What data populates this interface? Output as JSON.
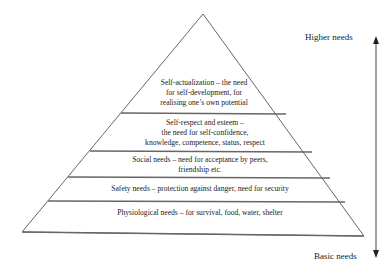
{
  "diagram": {
    "levels": [
      {
        "name": "self-actualization",
        "lines": [
          "Self-actualization – the need",
          "for self-development, for",
          "realising one’s own potential"
        ]
      },
      {
        "name": "self-respect",
        "lines": [
          "Self-respect and esteem –",
          "the need for self-confidence,",
          "knowledge, competence, status, respect"
        ]
      },
      {
        "name": "social",
        "lines": [
          "Social needs – need for acceptance by peers,",
          "friendship etc."
        ]
      },
      {
        "name": "safety",
        "lines": [
          "Safety needs – protection against danger, need for security"
        ]
      },
      {
        "name": "physiological",
        "lines": [
          "Physiological needs – for survival, food, water, shelter"
        ]
      }
    ],
    "axis": {
      "top_label": "Higher needs",
      "bottom_label": "Basic needs"
    },
    "colors": {
      "line": "#555555",
      "text": "#222222"
    }
  }
}
